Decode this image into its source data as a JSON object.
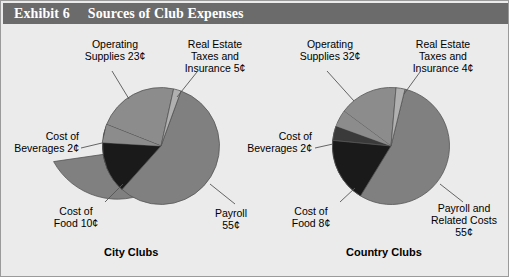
{
  "header": {
    "exhibit_number": "Exhibit 6",
    "title": "Sources of Club Expenses"
  },
  "colors": {
    "header_bar": "#6b6b6b",
    "background": "#ebebeb",
    "border": "#9a9a9a",
    "payroll": "#808080",
    "operating_supplies": "#8c8c8c",
    "cost_of_food": "#1a1a1a",
    "cost_of_beverages": "#3a3a3a",
    "real_estate_taxes": "#b0b0b0",
    "slice_outline": "#555555",
    "leader_line": "#555555",
    "text": "#000000"
  },
  "charts": [
    {
      "caption": "City Clubs",
      "labels": {
        "operating_supplies": "Operating\nSupplies 23¢",
        "real_estate": "Real Estate\nTaxes and\nInsurance 5¢",
        "beverages": "Cost of\nBeverages 2¢",
        "food": "Cost of\nFood 10¢",
        "payroll": "Payroll\n55¢"
      }
    },
    {
      "caption": "Country Clubs",
      "labels": {
        "operating_supplies": "Operating\nSupplies 32¢",
        "real_estate": "Real Estate\nTaxes and\nInsurance 4¢",
        "beverages": "Cost of\nBeverages 2¢",
        "food": "Cost of\nFood 8¢",
        "payroll": "Payroll and\nRelated Costs\n55¢"
      }
    }
  ],
  "chart_data": [
    {
      "type": "pie",
      "title": "City Clubs",
      "unit": "cents per dollar",
      "categories": [
        "Payroll",
        "Operating Supplies",
        "Cost of Food",
        "Real Estate Taxes and Insurance",
        "Cost of Beverages"
      ],
      "values": [
        55,
        23,
        10,
        5,
        2
      ],
      "labels": [
        "Payroll 55¢",
        "Operating Supplies 23¢",
        "Cost of Food 10¢",
        "Real Estate Taxes and Insurance 5¢",
        "Cost of Beverages 2¢"
      ],
      "colors": [
        "#808080",
        "#8c8c8c",
        "#1a1a1a",
        "#b0b0b0",
        "#3a3a3a"
      ],
      "legend": "none",
      "labels_position": "outside-with-leader-lines",
      "total": 95
    },
    {
      "type": "pie",
      "title": "Country Clubs",
      "unit": "cents per dollar",
      "categories": [
        "Payroll and Related Costs",
        "Operating Supplies",
        "Cost of Food",
        "Real Estate Taxes and Insurance",
        "Cost of Beverages"
      ],
      "values": [
        55,
        32,
        8,
        4,
        2
      ],
      "labels": [
        "Payroll and Related Costs 55¢",
        "Operating Supplies 32¢",
        "Cost of Food 8¢",
        "Real Estate Taxes and Insurance 4¢",
        "Cost of Beverages 2¢"
      ],
      "colors": [
        "#808080",
        "#8c8c8c",
        "#1a1a1a",
        "#b0b0b0",
        "#3a3a3a"
      ],
      "legend": "none",
      "labels_position": "outside-with-leader-lines",
      "total": 101
    }
  ]
}
